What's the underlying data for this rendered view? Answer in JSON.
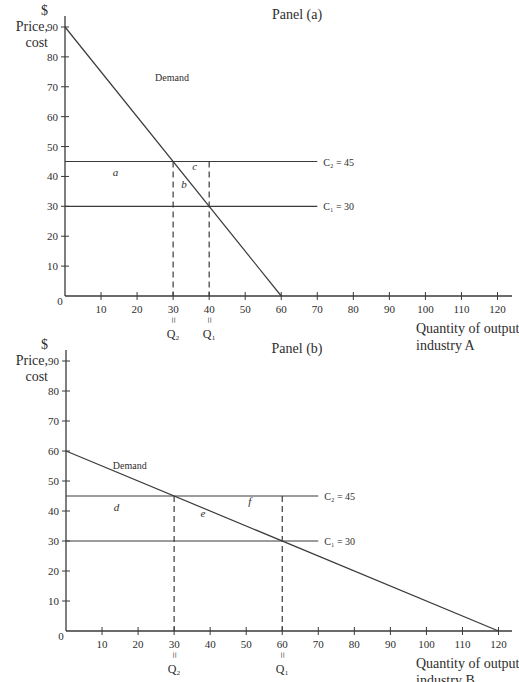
{
  "figure": {
    "width": 519,
    "height": 682,
    "colors": {
      "ink": "#3a3a3a",
      "text": "#2e2e2e",
      "background": "#ffffff"
    }
  },
  "chart_data": [
    {
      "type": "line",
      "title": "Panel (a)",
      "ylabel_lines": [
        "$",
        "Price,",
        "cost"
      ],
      "xlabel_lines": [
        "Quantity of output",
        "industry A"
      ],
      "xlim": [
        0,
        120
      ],
      "ylim": [
        0,
        90
      ],
      "x_ticks": [
        10,
        20,
        30,
        40,
        50,
        60,
        70,
        80,
        90,
        100,
        110,
        120
      ],
      "y_ticks": [
        10,
        20,
        30,
        40,
        50,
        60,
        70,
        80,
        90
      ],
      "origin_label": "0",
      "grid": false,
      "series": [
        {
          "name": "Demand",
          "label": "Demand",
          "x": [
            0,
            60
          ],
          "y": [
            90,
            0
          ],
          "label_pos": [
            25,
            72
          ]
        }
      ],
      "hlines": [
        {
          "name": "C2",
          "label": "C₂ = 45",
          "y": 45,
          "x_end": 70
        },
        {
          "name": "C1",
          "label": "C₁ = 30",
          "y": 30,
          "x_end": 70
        }
      ],
      "vlines_dashed": [
        {
          "name": "Q2",
          "x": 30,
          "y_top": 45,
          "label": "Q₂"
        },
        {
          "name": "Q1",
          "x": 40,
          "y_top": 45,
          "label": "Q₁"
        }
      ],
      "regions": [
        {
          "label": "a",
          "x": 14,
          "y": 40
        },
        {
          "label": "b",
          "x": 33,
          "y": 36
        },
        {
          "label": "c",
          "x": 36,
          "y": 42
        }
      ],
      "frame": {
        "left": 65,
        "top": 27,
        "right": 497.5,
        "bottom": 296,
        "axis_end_x": 512,
        "axis_top_y": 16
      }
    },
    {
      "type": "line",
      "title": "Panel (b)",
      "ylabel_lines": [
        "$",
        "Price,",
        "cost"
      ],
      "xlabel_lines": [
        "Quantity of output",
        "industry B"
      ],
      "xlim": [
        0,
        120
      ],
      "ylim": [
        0,
        90
      ],
      "x_ticks": [
        10,
        20,
        30,
        40,
        50,
        60,
        70,
        80,
        90,
        100,
        110,
        120
      ],
      "y_ticks": [
        10,
        20,
        30,
        40,
        50,
        60,
        70,
        80,
        90
      ],
      "origin_label": "0",
      "grid": false,
      "series": [
        {
          "name": "Demand",
          "label": "Demand",
          "x": [
            0,
            120
          ],
          "y": [
            60,
            0
          ],
          "label_pos": [
            13,
            54
          ]
        }
      ],
      "hlines": [
        {
          "name": "C2",
          "label": "C₂ = 45",
          "y": 45,
          "x_end": 70
        },
        {
          "name": "C1",
          "label": "C₁ = 30",
          "y": 30,
          "x_end": 70
        }
      ],
      "vlines_dashed": [
        {
          "name": "Q2",
          "x": 30,
          "y_top": 45,
          "label": "Q₂"
        },
        {
          "name": "Q1",
          "x": 60,
          "y_top": 45,
          "label": "Q₁"
        }
      ],
      "regions": [
        {
          "label": "d",
          "x": 14,
          "y": 40
        },
        {
          "label": "e",
          "x": 38,
          "y": 38
        },
        {
          "label": "f",
          "x": 51,
          "y": 42
        }
      ],
      "frame": {
        "left": 66,
        "top": 361,
        "right": 498.5,
        "bottom": 631,
        "axis_end_x": 512,
        "axis_top_y": 350
      }
    }
  ]
}
